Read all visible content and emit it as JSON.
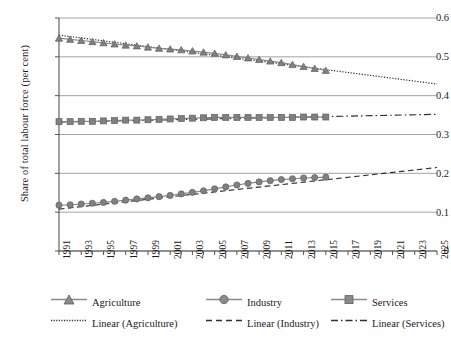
{
  "chart_data": {
    "type": "line",
    "title": "",
    "xlabel": "",
    "ylabel": "Share of total labour force (per cent)",
    "ylim": [
      0,
      0.6
    ],
    "xlim": [
      1991,
      2025
    ],
    "yticks": [
      "0",
      "0.1",
      "0.2",
      "0.3",
      "0.4",
      "0.5",
      "0.6"
    ],
    "ytick_values": [
      0,
      0.1,
      0.2,
      0.3,
      0.4,
      0.5,
      0.6
    ],
    "grid": "horizontal",
    "legend_position": "bottom",
    "x": [
      1991,
      1992,
      1993,
      1994,
      1995,
      1996,
      1997,
      1998,
      1999,
      2000,
      2001,
      2002,
      2003,
      2004,
      2005,
      2006,
      2007,
      2008,
      2009,
      2010,
      2011,
      2012,
      2013,
      2014,
      2015
    ],
    "xticks": [
      "1991",
      "1993",
      "1995",
      "1997",
      "1999",
      "2001",
      "2003",
      "2005",
      "2007",
      "2009",
      "2011",
      "2013",
      "2015",
      "2017",
      "2019",
      "2021",
      "2023",
      "2025"
    ],
    "xtick_values": [
      1991,
      1993,
      1995,
      1997,
      1999,
      2001,
      2003,
      2005,
      2007,
      2009,
      2011,
      2013,
      2015,
      2017,
      2019,
      2021,
      2023,
      2025
    ],
    "series": [
      {
        "name": "Agriculture",
        "marker": "triangle",
        "color": "#808080",
        "values": [
          0.548,
          0.545,
          0.542,
          0.539,
          0.536,
          0.533,
          0.53,
          0.528,
          0.525,
          0.522,
          0.52,
          0.518,
          0.515,
          0.512,
          0.509,
          0.505,
          0.501,
          0.497,
          0.493,
          0.489,
          0.485,
          0.48,
          0.475,
          0.47,
          0.465
        ]
      },
      {
        "name": "Industry",
        "marker": "circle",
        "color": "#808080",
        "values": [
          0.118,
          0.119,
          0.121,
          0.123,
          0.125,
          0.128,
          0.131,
          0.134,
          0.137,
          0.14,
          0.143,
          0.147,
          0.151,
          0.155,
          0.16,
          0.165,
          0.17,
          0.174,
          0.178,
          0.181,
          0.184,
          0.186,
          0.188,
          0.189,
          0.19
        ]
      },
      {
        "name": "Services",
        "marker": "square",
        "color": "#808080",
        "values": [
          0.333,
          0.333,
          0.334,
          0.334,
          0.335,
          0.336,
          0.337,
          0.337,
          0.338,
          0.339,
          0.34,
          0.341,
          0.342,
          0.343,
          0.344,
          0.344,
          0.344,
          0.344,
          0.344,
          0.344,
          0.344,
          0.344,
          0.345,
          0.345,
          0.345
        ]
      }
    ],
    "trendlines": [
      {
        "name": "Linear (Agriculture)",
        "style": "dotted",
        "color": "#303030",
        "x": [
          1991,
          2025
        ],
        "y": [
          0.556,
          0.43
        ]
      },
      {
        "name": "Linear (Industry)",
        "style": "dashed",
        "color": "#303030",
        "x": [
          1991,
          2025
        ],
        "y": [
          0.108,
          0.215
        ]
      },
      {
        "name": "Linear (Services)",
        "style": "dash-dot",
        "color": "#303030",
        "x": [
          1991,
          2025
        ],
        "y": [
          0.332,
          0.352
        ]
      }
    ]
  },
  "legend": {
    "items": [
      {
        "label": "Agriculture",
        "glyph": "triangle-marker-icon"
      },
      {
        "label": "Industry",
        "glyph": "circle-marker-icon"
      },
      {
        "label": "Services",
        "glyph": "square-marker-icon"
      },
      {
        "label": "Linear (Agriculture)",
        "glyph": "dotted-line-icon"
      },
      {
        "label": "Linear (Industry)",
        "glyph": "dashed-line-icon"
      },
      {
        "label": "Linear (Services)",
        "glyph": "dash-dot-line-icon"
      }
    ]
  },
  "colors": {
    "marker": "#808080",
    "line": "#8a8a8a",
    "trend": "#303030",
    "axis": "#555555",
    "grid": "#8c8c8c",
    "text": "#1a1a1a",
    "background": "#ffffff"
  }
}
